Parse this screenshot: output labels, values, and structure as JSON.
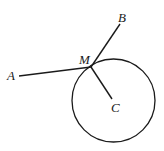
{
  "diagram": {
    "type": "geometry",
    "stroke_color": "#1a1a1a",
    "background": "#ffffff",
    "circle": {
      "center_label": "C",
      "cx": 113.5,
      "cy": 100.5,
      "r": 41.5
    },
    "points": {
      "A": {
        "label": "A",
        "x": 19,
        "y": 74
      },
      "B": {
        "label": "B",
        "x": 120,
        "y": 24
      },
      "M": {
        "label": "M",
        "x": 91,
        "y": 67
      },
      "C": {
        "label": "C",
        "x": 112,
        "y": 100
      }
    },
    "segments": [
      {
        "from": "A",
        "to": "M"
      },
      {
        "from": "M",
        "to": "B"
      },
      {
        "from": "M",
        "to": "C"
      }
    ],
    "labels": {
      "A": "A",
      "B": "B",
      "M": "M",
      "C": "C"
    }
  }
}
